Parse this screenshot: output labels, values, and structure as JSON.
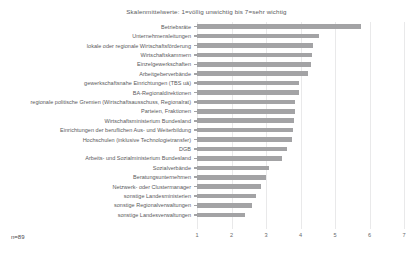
{
  "chart_data": {
    "type": "bar",
    "orientation": "horizontal",
    "title": "Skalenmittelwerte: 1=völlig unwichtig bis 7=sehr wichtig",
    "xlabel": "",
    "ylabel": "",
    "xlim": [
      1,
      7
    ],
    "xticks": [
      "1",
      "2",
      "3",
      "4",
      "5",
      "6",
      "7"
    ],
    "grid": true,
    "legend": false,
    "bar_color": "#a3a3a5",
    "annotation": "n=89",
    "categories": [
      "Betriebsräte",
      "Unternehmensleitungen",
      "lokale oder regionale Wirtschaftsförderung",
      "Wirtschaftskammern",
      "Einzelgewerkschaften",
      "Arbeitgeberverbände",
      "gewerkschaftsnahe Einrichtungen (TBS uä)",
      "BA-Regionaldirektionen",
      "regionale politische Gremien (Wirtschaftsausschuss, Regionalrat)",
      "Parteien, Fraktionen",
      "Wirtschaftsministerium Bundesland",
      "Einrichtungen der beruflichen Aus- und Weiterbildung",
      "Hochschulen (inklusive Technologietransfer)",
      "DGB",
      "Arbeits- und Sozialministerium Bundesland",
      "Sozialverbände",
      "Beratungsunternehmen",
      "Netzwerk- oder Clustermanager",
      "sonstige Landesministerien",
      "sonstige Regionalverwaltungen",
      "sonstige Landesverwaltungen"
    ],
    "values": [
      5.75,
      4.55,
      4.35,
      4.32,
      4.3,
      4.22,
      3.95,
      3.95,
      3.85,
      3.83,
      3.8,
      3.78,
      3.75,
      3.62,
      3.45,
      3.1,
      3.0,
      2.85,
      2.72,
      2.58,
      2.4
    ]
  }
}
